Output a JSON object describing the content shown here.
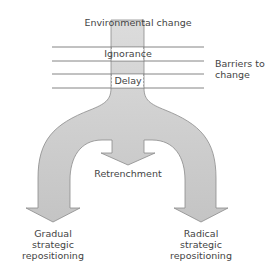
{
  "diagram": {
    "top_label": "Environmental change",
    "barriers": [
      {
        "label": "Ignorance"
      },
      {
        "label": "Delay"
      }
    ],
    "barriers_label": "Barriers to change",
    "barriers_label_lines": [
      "Barriers to",
      "change"
    ],
    "outcomes": {
      "middle": "Retrenchment",
      "left": [
        "Gradual",
        "strategic",
        "repositioning"
      ],
      "right": [
        "Radical",
        "strategic",
        "repositioning"
      ]
    },
    "colors": {
      "arrow_fill": "#d4d4d4",
      "arrow_stroke": "#8a8a8a",
      "line": "#777777",
      "text": "#444444"
    }
  }
}
